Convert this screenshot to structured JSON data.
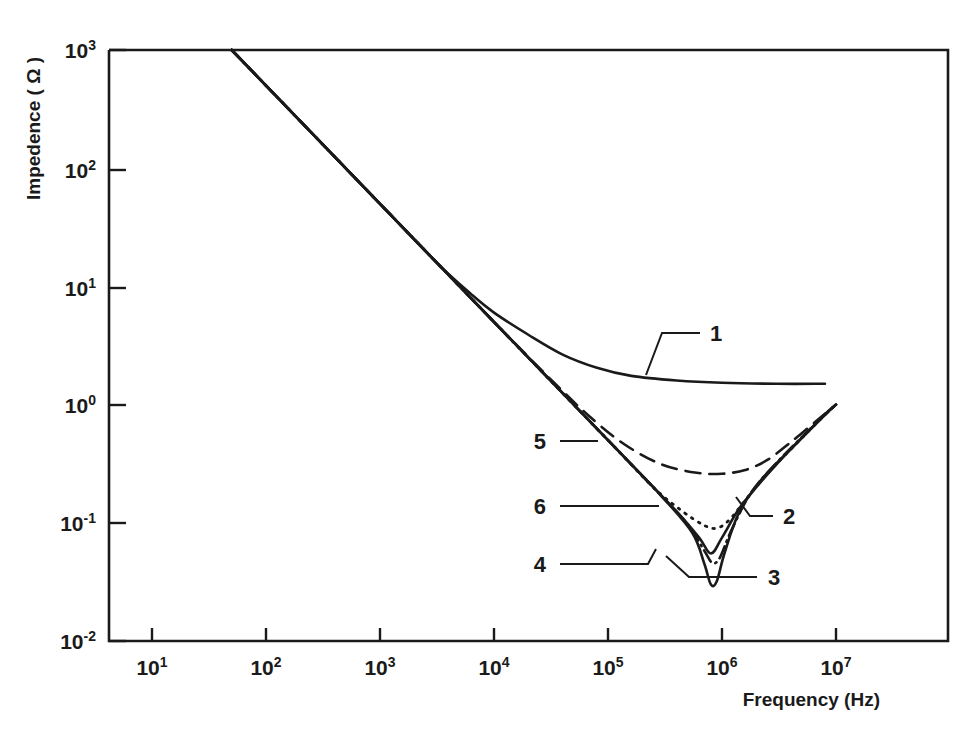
{
  "chart_data": {
    "type": "line",
    "title": "",
    "xlabel": "Frequency (Hz)",
    "ylabel": "Impedence ( Ω )",
    "xscale": "log",
    "yscale": "log",
    "xlim": [
      3.2,
      32000000
    ],
    "ylim": [
      0.01,
      1000
    ],
    "grid": false,
    "legend": "inline-labels",
    "x_tick_labels": [
      "10",
      "10",
      "10",
      "10",
      "10",
      "10",
      "10"
    ],
    "x_tick_exponents": [
      "1",
      "2",
      "3",
      "4",
      "5",
      "6",
      "7"
    ],
    "x_tick_values": [
      10,
      100,
      1000,
      10000,
      100000,
      1000000,
      10000000
    ],
    "y_tick_labels": [
      "10",
      "10",
      "10",
      "10",
      "10",
      "10"
    ],
    "y_tick_exponents": [
      "3",
      "2",
      "1",
      "0",
      "-1",
      "-2"
    ],
    "y_tick_values": [
      1000,
      100,
      10,
      1,
      0.1,
      0.01
    ],
    "series": [
      {
        "name": "1",
        "label": "1",
        "style": "solid",
        "points": [
          [
            50,
            1000
          ],
          [
            100,
            500
          ],
          [
            316,
            158
          ],
          [
            1000,
            50
          ],
          [
            3160,
            15.8
          ],
          [
            6300,
            8.6
          ],
          [
            10000,
            6.0
          ],
          [
            20000,
            3.9
          ],
          [
            40000,
            2.65
          ],
          [
            80000,
            2.05
          ],
          [
            160000,
            1.75
          ],
          [
            400000,
            1.6
          ],
          [
            1000000,
            1.53
          ],
          [
            3000000,
            1.5
          ],
          [
            8000000,
            1.5
          ]
        ]
      },
      {
        "name": "2",
        "label": "2",
        "style": "solid",
        "points": [
          [
            50,
            1000
          ],
          [
            1000,
            50
          ],
          [
            10000,
            5.0
          ],
          [
            40000,
            1.25
          ],
          [
            100000,
            0.5
          ],
          [
            200000,
            0.25
          ],
          [
            400000,
            0.125
          ],
          [
            630000,
            0.075
          ],
          [
            800000,
            0.055
          ],
          [
            1000000,
            0.075
          ],
          [
            1400000,
            0.13
          ],
          [
            2000000,
            0.2
          ],
          [
            3160000,
            0.33
          ],
          [
            5000000,
            0.52
          ],
          [
            8000000,
            0.83
          ],
          [
            10000000,
            1.0
          ]
        ]
      },
      {
        "name": "3",
        "label": "3",
        "style": "dash-dot",
        "points": [
          [
            50,
            1000
          ],
          [
            1000,
            50
          ],
          [
            10000,
            5.0
          ],
          [
            100000,
            0.5
          ],
          [
            300000,
            0.165
          ],
          [
            500000,
            0.097
          ],
          [
            700000,
            0.058
          ],
          [
            820000,
            0.046
          ],
          [
            950000,
            0.05
          ],
          [
            1200000,
            0.085
          ],
          [
            1800000,
            0.18
          ],
          [
            3000000,
            0.32
          ],
          [
            6000000,
            0.63
          ],
          [
            10000000,
            1.0
          ]
        ]
      },
      {
        "name": "4",
        "label": "4",
        "style": "solid",
        "points": [
          [
            50,
            1000
          ],
          [
            1000,
            50
          ],
          [
            10000,
            5.0
          ],
          [
            100000,
            0.5
          ],
          [
            300000,
            0.165
          ],
          [
            550000,
            0.082
          ],
          [
            700000,
            0.045
          ],
          [
            800000,
            0.03
          ],
          [
            900000,
            0.032
          ],
          [
            1050000,
            0.055
          ],
          [
            1400000,
            0.12
          ],
          [
            2200000,
            0.23
          ],
          [
            4000000,
            0.42
          ],
          [
            7000000,
            0.72
          ],
          [
            10000000,
            1.0
          ]
        ]
      },
      {
        "name": "5",
        "label": "5",
        "style": "dashed",
        "points": [
          [
            50,
            1000
          ],
          [
            1000,
            50
          ],
          [
            10000,
            5.0
          ],
          [
            40000,
            1.3
          ],
          [
            80000,
            0.7
          ],
          [
            150000,
            0.44
          ],
          [
            300000,
            0.31
          ],
          [
            600000,
            0.265
          ],
          [
            1000000,
            0.26
          ],
          [
            1600000,
            0.28
          ],
          [
            2500000,
            0.34
          ],
          [
            4000000,
            0.48
          ],
          [
            7000000,
            0.75
          ],
          [
            10000000,
            1.0
          ]
        ]
      },
      {
        "name": "6",
        "label": "6",
        "style": "dotted",
        "points": [
          [
            50,
            1000
          ],
          [
            1000,
            50
          ],
          [
            10000,
            5.0
          ],
          [
            100000,
            0.5
          ],
          [
            250000,
            0.2
          ],
          [
            450000,
            0.125
          ],
          [
            700000,
            0.095
          ],
          [
            900000,
            0.09
          ],
          [
            1150000,
            0.105
          ],
          [
            1600000,
            0.155
          ],
          [
            2500000,
            0.26
          ],
          [
            4500000,
            0.47
          ],
          [
            8000000,
            0.82
          ],
          [
            10000000,
            1.0
          ]
        ]
      }
    ],
    "annotations": [
      {
        "label": "1",
        "x": 715,
        "y": 339
      },
      {
        "label": "2",
        "x": 783,
        "y": 522
      },
      {
        "label": "3",
        "x": 770,
        "y": 583
      },
      {
        "label": "4",
        "x": 545,
        "y": 570
      },
      {
        "label": "5",
        "x": 545,
        "y": 447
      },
      {
        "label": "6",
        "x": 545,
        "y": 512
      }
    ]
  }
}
